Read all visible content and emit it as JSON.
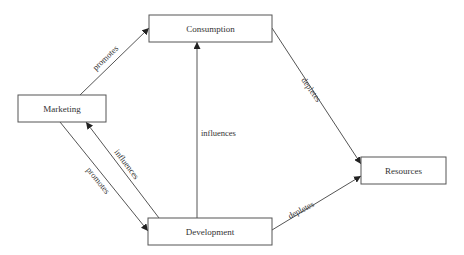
{
  "diagram": {
    "nodes": [
      {
        "id": "marketing",
        "label": "Marketing",
        "x": 18,
        "y": 95,
        "w": 88,
        "h": 27
      },
      {
        "id": "consumption",
        "label": "Consumption",
        "x": 149,
        "y": 15,
        "w": 123,
        "h": 27
      },
      {
        "id": "development",
        "label": "Development",
        "x": 148,
        "y": 218,
        "w": 124,
        "h": 27
      },
      {
        "id": "resources",
        "label": "Resources",
        "x": 361,
        "y": 157,
        "w": 85,
        "h": 27
      }
    ],
    "edges": [
      {
        "from": "marketing",
        "to": "consumption",
        "label": "promotes"
      },
      {
        "from": "marketing",
        "to": "development",
        "label": "promotes"
      },
      {
        "from": "development",
        "to": "marketing",
        "label": "influences"
      },
      {
        "from": "development",
        "to": "consumption",
        "label": "influences"
      },
      {
        "from": "consumption",
        "to": "resources",
        "label": "depletes"
      },
      {
        "from": "development",
        "to": "resources",
        "label": "depletes"
      }
    ]
  }
}
